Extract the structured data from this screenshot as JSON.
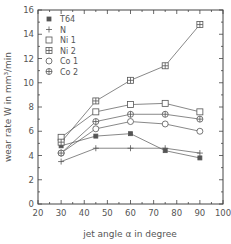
{
  "chart_data": {
    "type": "line",
    "title": "",
    "xlabel": "jet angle α in degree",
    "ylabel": "wear rate W in mm³/min",
    "xlim": [
      20,
      100
    ],
    "ylim": [
      0,
      16
    ],
    "x_ticks": [
      20,
      30,
      40,
      50,
      60,
      70,
      80,
      90,
      100
    ],
    "y_ticks": [
      0,
      2,
      4,
      6,
      8,
      10,
      12,
      14,
      16
    ],
    "grid": false,
    "legend_position": "upper-left",
    "x": [
      30,
      45,
      60,
      75,
      90
    ],
    "series": [
      {
        "name": "T64",
        "marker": "filled-square",
        "values": [
          4.8,
          5.6,
          5.8,
          4.4,
          3.8
        ]
      },
      {
        "name": "N",
        "marker": "plus",
        "values": [
          3.5,
          4.6,
          4.6,
          4.6,
          4.2
        ]
      },
      {
        "name": "Ni 1",
        "marker": "open-square",
        "values": [
          5.5,
          7.6,
          8.2,
          8.3,
          7.6
        ]
      },
      {
        "name": "Ni 2",
        "marker": "crossed-square",
        "values": [
          5.1,
          8.5,
          10.2,
          11.4,
          14.8
        ]
      },
      {
        "name": "Co 1",
        "marker": "open-circle",
        "values": [
          4.2,
          6.2,
          6.8,
          6.6,
          6.0
        ]
      },
      {
        "name": "Co 2",
        "marker": "crossed-circle",
        "values": [
          4.2,
          6.8,
          7.4,
          7.4,
          7.0
        ]
      }
    ]
  },
  "colors": {
    "line": "#555555",
    "axis": "#444444",
    "background": "#ffffff"
  }
}
